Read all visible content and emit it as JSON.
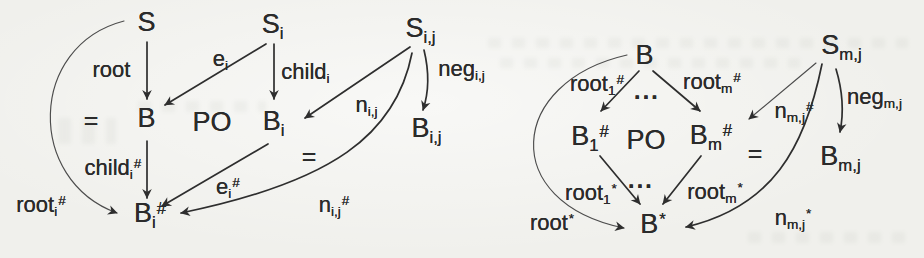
{
  "colors": {
    "ink": "#2b2b2b",
    "paper": "#f0f0ec"
  },
  "left_diagram": {
    "nodes": {
      "S": {
        "base": "S"
      },
      "Si": {
        "base": "S",
        "sub": "i"
      },
      "Sij": {
        "base": "S",
        "sub": "i,j"
      },
      "eq_outer": {
        "base": "="
      },
      "B": {
        "base": "B"
      },
      "PO": {
        "base": "PO"
      },
      "Bi": {
        "base": "B",
        "sub": "i"
      },
      "eq_inner": {
        "base": "="
      },
      "Bij": {
        "base": "B",
        "sub": "i,j"
      },
      "Bi_hash": {
        "base": "B",
        "sub": "i",
        "sup": "#"
      }
    },
    "edge_labels": {
      "root": {
        "base": "root"
      },
      "e_i": {
        "base": "e",
        "sub": "i"
      },
      "child_i": {
        "base": "child",
        "sub": "i"
      },
      "n_ij": {
        "base": "n",
        "sub": "i,j"
      },
      "neg_ij": {
        "base": "neg",
        "sub": "i,j"
      },
      "child_i_hash": {
        "base": "child",
        "sub": "i",
        "sup": "#"
      },
      "e_i_hash": {
        "base": "e",
        "sub": "i",
        "sup": "#"
      },
      "n_ij_hash": {
        "base": "n",
        "sub": "i,j",
        "sup": "#"
      },
      "root_i_hash": {
        "base": "root",
        "sub": "i",
        "sup": "#"
      }
    }
  },
  "right_diagram": {
    "nodes": {
      "B": {
        "base": "B"
      },
      "Smj": {
        "base": "S",
        "sub": "m,j"
      },
      "B1_hash": {
        "base": "B",
        "sub": "1",
        "sup": "#"
      },
      "PO": {
        "base": "PO"
      },
      "Bm_hash": {
        "base": "B",
        "sub": "m",
        "sup": "#"
      },
      "eq": {
        "base": "="
      },
      "Bmj": {
        "base": "B",
        "sub": "m,j"
      },
      "B_star": {
        "base": "B",
        "sup": "*"
      },
      "dots_top": {
        "base": "···"
      },
      "dots_bottom": {
        "base": "···"
      }
    },
    "edge_labels": {
      "root_1_hash": {
        "base": "root",
        "sub": "1",
        "sup": "#"
      },
      "root_m_hash": {
        "base": "root",
        "sub": "m",
        "sup": "#"
      },
      "n_mj_hash": {
        "base": "n",
        "sub": "m,j",
        "sup": "#"
      },
      "neg_mj": {
        "base": "neg",
        "sub": "m,j"
      },
      "root_1_star": {
        "base": "root",
        "sub": "1",
        "sup": "*"
      },
      "root_m_star": {
        "base": "root",
        "sub": "m",
        "sup": "*"
      },
      "root_star": {
        "base": "root",
        "sup": "*"
      },
      "n_mj_star": {
        "base": "n",
        "sub": "m,j",
        "sup": "*"
      }
    }
  }
}
